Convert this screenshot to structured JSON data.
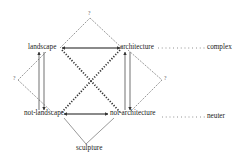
{
  "diagram": {
    "nodes": {
      "top_left": "landscape",
      "top_right": "architecture",
      "bottom_left": "not-landscape",
      "bottom_right": "not-architecture",
      "bottom": "sculpture",
      "right_top": "complex",
      "right_bottom": "neuter"
    },
    "apex_labels": {
      "top": "?",
      "left": "?",
      "right": "?"
    },
    "colors": {
      "line": "#444444",
      "dotted": "#333333",
      "text": "#222222"
    }
  }
}
